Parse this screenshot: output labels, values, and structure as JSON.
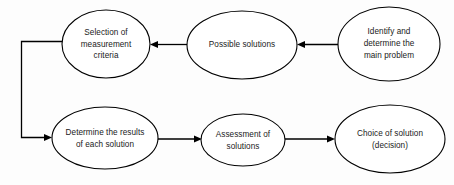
{
  "diagram": {
    "background_color": "#fdfdfd",
    "stroke_color": "#000000",
    "text_color": "#1a1a1a",
    "nodes": [
      {
        "id": "selection-of-measurement-criteria",
        "shape": "ellipse",
        "cx": 106,
        "cy": 44,
        "rx": 44,
        "ry": 34,
        "lines": [
          "Selection of",
          "measurement",
          "criteria"
        ],
        "line1": "Selection of",
        "line2": "measurement",
        "line3": "criteria"
      },
      {
        "id": "possible-solutions",
        "shape": "ellipse",
        "cx": 242,
        "cy": 45,
        "rx": 55,
        "ry": 34,
        "lines": [
          "Possible solutions"
        ],
        "line1": "Possible solutions",
        "line2": "",
        "line3": ""
      },
      {
        "id": "identify-and-determine-the-main-problem",
        "shape": "ellipse",
        "cx": 389,
        "cy": 44,
        "rx": 51,
        "ry": 37,
        "lines": [
          "Identify and",
          "determine the",
          "main problem"
        ],
        "line1": "Identify and",
        "line2": "determine the",
        "line3": "main problem"
      },
      {
        "id": "determine-the-results-of-each-solution",
        "shape": "ellipse",
        "cx": 105,
        "cy": 138,
        "rx": 53,
        "ry": 31,
        "lines": [
          "Determine the results",
          "of each solution"
        ],
        "line1": "Determine the results",
        "line2": "of each solution",
        "line3": ""
      },
      {
        "id": "assessment-of-solutions",
        "shape": "ellipse",
        "cx": 243,
        "cy": 140,
        "rx": 42,
        "ry": 26,
        "lines": [
          "Assessment of",
          "solutions"
        ],
        "line1": "Assessment of",
        "line2": "solutions",
        "line3": ""
      },
      {
        "id": "choice-of-solution-decision",
        "shape": "ellipse",
        "cx": 390,
        "cy": 139,
        "rx": 55,
        "ry": 34,
        "lines": [
          "Choice of solution",
          "(decision)"
        ],
        "line1": "Choice of solution",
        "line2": "(decision)",
        "line3": ""
      }
    ],
    "edges": [
      {
        "id": "edge-identify-to-possible-solutions",
        "from": "identify-and-determine-the-main-problem",
        "to": "possible-solutions",
        "direction": "leftward",
        "label": ""
      },
      {
        "id": "edge-possible-solutions-to-selection",
        "from": "possible-solutions",
        "to": "selection-of-measurement-criteria",
        "direction": "leftward",
        "label": ""
      },
      {
        "id": "edge-selection-to-determine-results",
        "from": "selection-of-measurement-criteria",
        "to": "determine-the-results-of-each-solution",
        "direction": "left-down-right",
        "label": ""
      },
      {
        "id": "edge-determine-results-to-assessment",
        "from": "determine-the-results-of-each-solution",
        "to": "assessment-of-solutions",
        "direction": "rightward",
        "label": ""
      },
      {
        "id": "edge-assessment-to-choice",
        "from": "assessment-of-solutions",
        "to": "choice-of-solution-decision",
        "direction": "rightward",
        "label": ""
      }
    ]
  }
}
